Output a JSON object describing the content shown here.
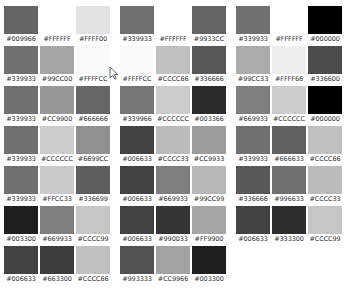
{
  "groups": [
    {
      "rows": [
        [
          "#009966",
          "#FFFFFF",
          "#FFFF00"
        ],
        [
          "#339933",
          "#99CC00",
          "#FFFFCC"
        ],
        [
          "#339933",
          "#CC9900",
          "#666666"
        ],
        [
          "#339933",
          "#CCCCCC",
          "#6699CC"
        ],
        [
          "#339933",
          "#FFCC33",
          "#336699"
        ],
        [
          "#003300",
          "#669933",
          "#CCCC99"
        ],
        [
          "#006633",
          "#663300",
          "#CCCC66"
        ]
      ]
    },
    {
      "rows": [
        [
          "#339933",
          "#FFFFFF",
          "#9933CC"
        ],
        [
          "#FFFFCC",
          "#CCCC66",
          "#336666"
        ],
        [
          "#339966",
          "#CCCCCC",
          "#003366"
        ],
        [
          "#006633",
          "#CCCC33",
          "#CC9933"
        ],
        [
          "#006633",
          "#669933",
          "#99CC99"
        ],
        [
          "#006633",
          "#990033",
          "#FF9900"
        ],
        [
          "#993333",
          "#CC9966",
          "#003300"
        ]
      ]
    },
    {
      "rows": [
        [
          "#339933",
          "#FFFFFF",
          "#000000"
        ],
        [
          "#99CC33",
          "#FFFF66",
          "#336600"
        ],
        [
          "#669933",
          "#CCCCCC",
          "#000000"
        ],
        [
          "#339933",
          "#666633",
          "#CCCC66"
        ],
        [
          "#336666",
          "#996633",
          "#CCCC33"
        ],
        [
          "#006633",
          "#333300",
          "#CCCC99"
        ]
      ]
    }
  ],
  "render_colors": {
    "note_hidden": "grayscale rendering of swatches as seen on screen"
  }
}
